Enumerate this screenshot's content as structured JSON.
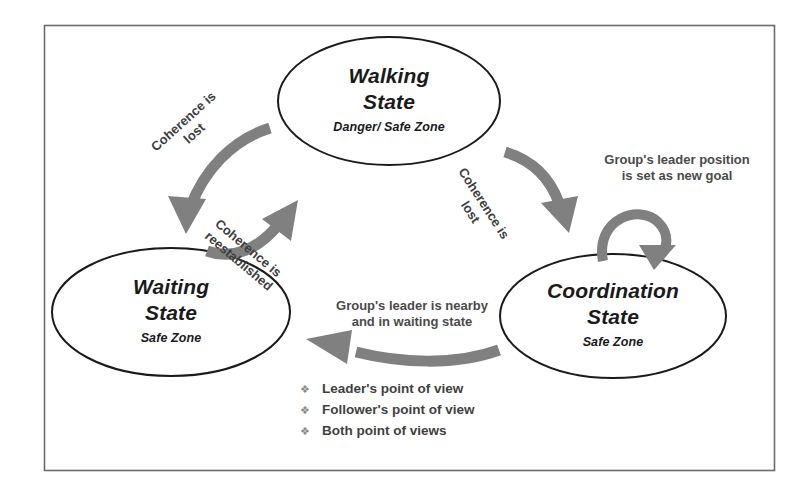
{
  "diagram": {
    "frame_color": "#6b6b6b",
    "node_stroke_color": "#1a1a1a",
    "arrow_color": "#808080",
    "nodes": [
      {
        "id": "walking",
        "title_line1": "Walking",
        "title_line2": "State",
        "zone": "Danger/ Safe Zone"
      },
      {
        "id": "waiting",
        "title_line1": "Waiting",
        "title_line2": "State",
        "zone": "Safe Zone"
      },
      {
        "id": "coordination",
        "title_line1": "Coordination",
        "title_line2": "State",
        "zone": "Safe Zone"
      }
    ],
    "edges": [
      {
        "id": "walking-to-waiting",
        "line1": "Coherence is",
        "line2": "lost"
      },
      {
        "id": "waiting-to-walking",
        "line1": "Coherence is",
        "line2": "reestablished"
      },
      {
        "id": "walking-to-coordination",
        "line1": "Coherence is",
        "line2": "lost"
      },
      {
        "id": "coordination-self-loop",
        "line1": "Group's leader position",
        "line2": "is set as new goal"
      },
      {
        "id": "coordination-to-waiting",
        "line1": "Group's leader is nearby",
        "line2": "and in waiting state"
      }
    ],
    "legend": {
      "bullet_glyph": "❖",
      "items": [
        "Leader's point of view",
        "Follower's point of view",
        "Both point of views"
      ]
    }
  }
}
